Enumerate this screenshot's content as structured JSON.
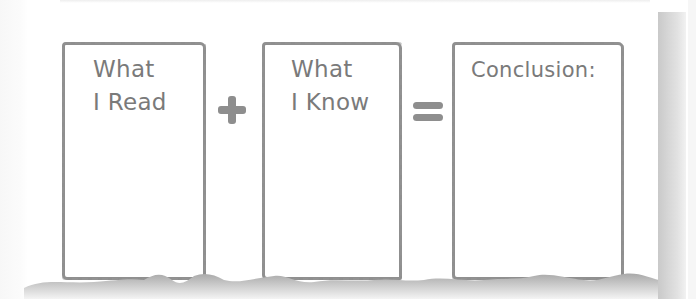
{
  "worksheet": {
    "boxes": [
      {
        "id": "read",
        "label": "What\nI Read"
      },
      {
        "id": "know",
        "label": "What\nI Know"
      },
      {
        "id": "conclusion",
        "label": "Conclusion:"
      }
    ],
    "operators": {
      "plus": "+",
      "equals": "="
    },
    "colors": {
      "ink": "#7a7a7a",
      "border": "#8f8f8f",
      "operator": "#8e8e8e",
      "shadow": "#c9c9c9",
      "paper": "#ffffff"
    }
  }
}
